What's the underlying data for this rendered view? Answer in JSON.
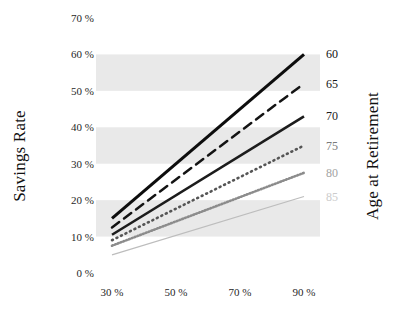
{
  "chart_data": {
    "type": "line",
    "title": "",
    "subtitle": "",
    "xlabel": "",
    "ylabel": "Savings Rate",
    "y2label": "Age at Retirement",
    "x": [
      30,
      50,
      70,
      90
    ],
    "xtick_labels": [
      "30 %",
      "50 %",
      "70 %",
      "90 %"
    ],
    "xlim": [
      25,
      95
    ],
    "ytick_labels": [
      "0 %",
      "10 %",
      "20 %",
      "30 %",
      "40 %",
      "50 %",
      "60 %",
      "70 %"
    ],
    "ytick_values": [
      0,
      10,
      20,
      30,
      40,
      50,
      60,
      70
    ],
    "ylim": [
      0,
      70
    ],
    "grid": false,
    "legend_position": "right-axis",
    "banded_background": true,
    "band_color": "#e9e9e9",
    "bands": [
      {
        "from": 10,
        "to": 20
      },
      {
        "from": 30,
        "to": 40
      },
      {
        "from": 50,
        "to": 60
      }
    ],
    "series": [
      {
        "name": "60",
        "label": "60",
        "style": "solid-thick",
        "color": "#0d0d0d",
        "width": 3.1,
        "dash": "none",
        "x": [
          30,
          90
        ],
        "values": [
          15,
          60
        ],
        "label_y": 60
      },
      {
        "name": "65",
        "label": "65",
        "style": "dashed",
        "color": "#141414",
        "width": 2.5,
        "dash": "9 6",
        "x": [
          30,
          90
        ],
        "values": [
          12.5,
          52
        ],
        "label_y": 52
      },
      {
        "name": "70",
        "label": "70",
        "style": "solid-medium",
        "color": "#1c1c1c",
        "width": 2.6,
        "dash": "none",
        "x": [
          30,
          90
        ],
        "values": [
          10.5,
          43
        ],
        "label_y": 43
      },
      {
        "name": "75",
        "label": "75",
        "style": "dotted",
        "color": "#555555",
        "width": 2.6,
        "dash": "1 4",
        "x": [
          30,
          90
        ],
        "values": [
          9,
          35
        ],
        "label_y": 35
      },
      {
        "name": "80",
        "label": "80",
        "style": "fine-dotted",
        "color": "#8c8c8c",
        "width": 2.6,
        "dash": "1 2",
        "x": [
          30,
          90
        ],
        "values": [
          7.5,
          27.5
        ],
        "label_y": 27.5
      },
      {
        "name": "85",
        "label": "85",
        "style": "thin-solid",
        "color": "#bdbdbd",
        "width": 1.3,
        "dash": "none",
        "x": [
          30,
          90
        ],
        "values": [
          5,
          21
        ],
        "label_y": 21
      }
    ],
    "right_axis_labels": [
      {
        "text": "60",
        "value": 60,
        "color": "#111111"
      },
      {
        "text": "65",
        "value": 52,
        "color": "#151515"
      },
      {
        "text": "70",
        "value": 43,
        "color": "#1d1d1d"
      },
      {
        "text": "75",
        "value": 35,
        "color": "#7a7a7a"
      },
      {
        "text": "80",
        "value": 27.5,
        "color": "#a3a3a3"
      },
      {
        "text": "85",
        "value": 21,
        "color": "#cccccc"
      }
    ]
  }
}
